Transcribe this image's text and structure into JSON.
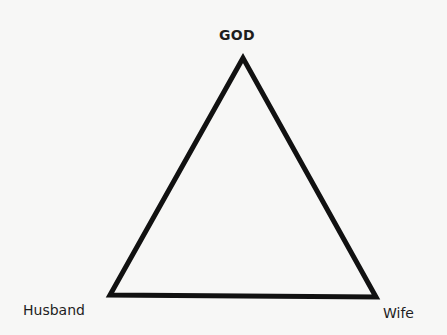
{
  "diagram": {
    "type": "triangle",
    "nodes": {
      "top": {
        "label": "GOD"
      },
      "bottom_left": {
        "label": "Husband"
      },
      "bottom_right": {
        "label": "Wife"
      }
    },
    "edges": [
      {
        "from": "GOD",
        "to": "Husband"
      },
      {
        "from": "GOD",
        "to": "Wife"
      },
      {
        "from": "Husband",
        "to": "Wife"
      }
    ],
    "colors": {
      "stroke": "#111111",
      "background": "#f7f7f6",
      "text": "#1e1e1e"
    }
  }
}
